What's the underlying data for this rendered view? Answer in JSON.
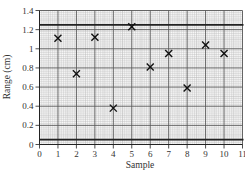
{
  "chart_data": {
    "type": "scatter",
    "title": "",
    "xlabel": "Sample",
    "ylabel": "Range (cm)",
    "xlim": [
      0,
      11
    ],
    "ylim": [
      0,
      1.4
    ],
    "x_ticks": [
      "0",
      "1",
      "2",
      "3",
      "4",
      "5",
      "6",
      "7",
      "8",
      "9",
      "10",
      "11"
    ],
    "y_ticks": [
      "0",
      "0.2",
      "0.4",
      "0.6",
      "0.8",
      "1",
      "1.2",
      "1.4"
    ],
    "grid": true,
    "marker": "x",
    "x": [
      1,
      2,
      3,
      4,
      5,
      6,
      7,
      8,
      9,
      10
    ],
    "y": [
      1.11,
      0.74,
      1.12,
      0.38,
      1.23,
      0.81,
      0.95,
      0.59,
      1.04,
      0.95
    ],
    "reference_lines": [
      {
        "orientation": "horizontal",
        "y": 1.25
      },
      {
        "orientation": "horizontal",
        "y": 0.05
      }
    ]
  },
  "colors": {
    "grid_minor": "#b8b8b8",
    "grid_major": "#555555",
    "marker": "#111111",
    "reference_line": "#222222"
  }
}
